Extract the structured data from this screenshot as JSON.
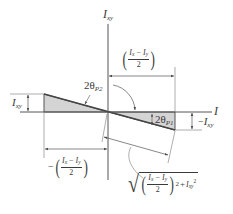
{
  "figure": {
    "type": "Mohr's circle principal-axes geometry diagram",
    "colors": {
      "line": "#4a4a4a",
      "fill": "#d4d4d4",
      "text": "#3a3a3a",
      "background": "#ffffff"
    }
  },
  "axes": {
    "vertical_label": {
      "base": "I",
      "sub": "xy"
    },
    "horizontal_label": {
      "base": "I",
      "sub": ""
    }
  },
  "labels": {
    "left_height": {
      "base": "I",
      "sub": "xy"
    },
    "right_height": {
      "prefix": "−",
      "base": "I",
      "sub": "xy"
    },
    "angle_p2": {
      "base": "2θ",
      "sub": "P2"
    },
    "angle_p1": {
      "base": "2θ",
      "sub": "P1"
    },
    "top_dim": {
      "num_a": "I",
      "num_a_sub": "x",
      "op": "−",
      "num_b": "I",
      "num_b_sub": "y",
      "den": "2"
    },
    "bottom_dim": {
      "prefix": "−",
      "num_a": "I",
      "num_a_sub": "x",
      "op": "−",
      "num_b": "I",
      "num_b_sub": "y",
      "den": "2"
    },
    "hypotenuse": {
      "radical": "√",
      "num_a": "I",
      "num_a_sub": "x",
      "op": "−",
      "num_b": "I",
      "num_b_sub": "y",
      "den": "2",
      "power": "2",
      "plus": "+",
      "term": "I",
      "term_sub": "xy",
      "term_power": "2"
    }
  }
}
